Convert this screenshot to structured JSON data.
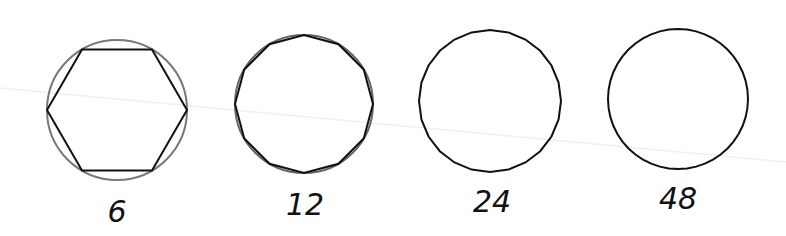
{
  "diagram": {
    "stroke_color": "#111111",
    "circle_color": "#777777",
    "figures": [
      {
        "sides": 6,
        "label": "6",
        "cx": 117,
        "cy": 110,
        "r": 70,
        "show_reference_circle": true
      },
      {
        "sides": 12,
        "label": "12",
        "cx": 304,
        "cy": 104,
        "r": 69,
        "show_reference_circle": true
      },
      {
        "sides": 24,
        "label": "24",
        "cx": 490,
        "cy": 101,
        "r": 71,
        "show_reference_circle": false
      },
      {
        "sides": 48,
        "label": "48",
        "cx": 678,
        "cy": 99,
        "r": 70,
        "show_reference_circle": false
      }
    ]
  }
}
